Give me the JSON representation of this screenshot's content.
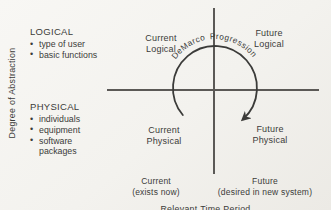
{
  "figure_type": "quadrant-diagram",
  "colors": {
    "background": "#f3f2ee",
    "line": "#565452",
    "text": "#3b3b39"
  },
  "y_axis": {
    "label": "Degree of Abstraction"
  },
  "x_axis": {
    "label": "Relevant Time Period",
    "ticks": [
      {
        "label": "Current",
        "sublabel": "(exists now)"
      },
      {
        "label": "Future",
        "sublabel": "(desired in new system)"
      }
    ]
  },
  "legend": {
    "bullet": "•",
    "logical": {
      "title": "LOGICAL",
      "items": [
        "type of user",
        "basic functions"
      ]
    },
    "physical": {
      "title": "PHYSICAL",
      "items": [
        "individuals",
        "equipment",
        "software packages"
      ]
    }
  },
  "quadrants": {
    "top_left": {
      "line1": "Current",
      "line2": "Logical"
    },
    "top_right": {
      "line1": "Future",
      "line2": "Logical"
    },
    "bottom_left": {
      "line1": "Current",
      "line2": "Physical"
    },
    "bottom_right": {
      "line1": "Future",
      "line2": "Physical"
    }
  },
  "arc": {
    "word1": "DeMarco",
    "word2": "Progression"
  }
}
